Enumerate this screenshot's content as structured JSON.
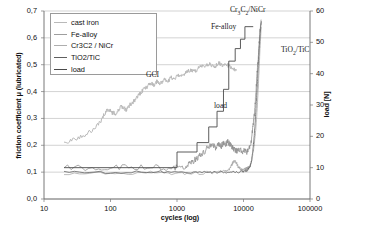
{
  "chart_data": {
    "type": "line",
    "title": "",
    "xlabel": "cycles (log)",
    "ylabel": "friction coefficient μ (lubricated)",
    "y2label": "load [N]",
    "xscale": "log",
    "xlim": [
      10,
      100000
    ],
    "ylim": [
      0.0,
      0.7
    ],
    "y2lim": [
      0,
      60
    ],
    "grid": true,
    "legend_position": "top-left",
    "xticks": [
      "10",
      "100",
      "1000",
      "10000",
      "100000"
    ],
    "xtick_values": [
      10,
      100,
      1000,
      10000,
      100000
    ],
    "yticks": [
      "0,0",
      "0,1",
      "0,2",
      "0,3",
      "0,4",
      "0,5",
      "0,6",
      "0,7"
    ],
    "ytick_values": [
      0.0,
      0.1,
      0.2,
      0.3,
      0.4,
      0.5,
      0.6,
      0.7
    ],
    "y2ticks": [
      "0",
      "10",
      "20",
      "30",
      "40",
      "50",
      "60"
    ],
    "y2tick_values": [
      0,
      10,
      20,
      30,
      40,
      50,
      60
    ],
    "series": [
      {
        "name": "cast iron",
        "color": "#b9b9b9",
        "axis": "left",
        "x": [
          20,
          28,
          40,
          55,
          72,
          85,
          95,
          105,
          118,
          130,
          145,
          160,
          175,
          195,
          215,
          240,
          270,
          300,
          330,
          360,
          400,
          450,
          500,
          560,
          640,
          720,
          820,
          930,
          1050,
          1200,
          1400,
          1600,
          1850,
          2100,
          2400,
          2800,
          3200,
          3700,
          4200,
          4800,
          5500,
          6200,
          7000,
          7800
        ],
        "y": [
          0.212,
          0.222,
          0.238,
          0.258,
          0.292,
          0.325,
          0.335,
          0.322,
          0.318,
          0.33,
          0.345,
          0.34,
          0.33,
          0.352,
          0.358,
          0.372,
          0.388,
          0.402,
          0.412,
          0.418,
          0.432,
          0.424,
          0.438,
          0.43,
          0.444,
          0.436,
          0.452,
          0.448,
          0.462,
          0.458,
          0.472,
          0.48,
          0.474,
          0.488,
          0.492,
          0.496,
          0.502,
          0.494,
          0.506,
          0.498,
          0.504,
          0.492,
          0.486,
          0.478
        ]
      },
      {
        "name": "Fe-alloy",
        "color": "#8c8c8c",
        "axis": "left",
        "x": [
          20,
          60,
          150,
          400,
          900,
          1300,
          1600,
          1900,
          2200,
          2600,
          3000,
          3400,
          3800,
          4200,
          4600,
          5000,
          5400,
          5800,
          6200,
          6600,
          7000,
          7600,
          8200,
          9000,
          9800,
          10600,
          11400,
          12200,
          13000,
          13800,
          14600,
          15400,
          16200,
          17000,
          17800,
          18400
        ],
        "y": [
          0.118,
          0.116,
          0.12,
          0.118,
          0.116,
          0.122,
          0.134,
          0.148,
          0.162,
          0.178,
          0.196,
          0.202,
          0.192,
          0.204,
          0.196,
          0.208,
          0.202,
          0.212,
          0.206,
          0.196,
          0.188,
          0.182,
          0.178,
          0.186,
          0.176,
          0.182,
          0.174,
          0.19,
          0.21,
          0.262,
          0.318,
          0.402,
          0.486,
          0.562,
          0.632,
          0.668
        ]
      },
      {
        "name": "Cr3C2 / NiCr",
        "color": "#a6a6a6",
        "axis": "left",
        "x": [
          20,
          100,
          400,
          1200,
          2500,
          4000,
          5200,
          6000,
          6600,
          7200,
          7800,
          8400,
          9000,
          9600,
          10200,
          10800,
          11400,
          12000,
          12600,
          13200,
          13800,
          14400,
          15200,
          16000,
          16800,
          17600,
          18400
        ],
        "y": [
          0.096,
          0.094,
          0.098,
          0.095,
          0.097,
          0.1,
          0.104,
          0.108,
          0.126,
          0.142,
          0.136,
          0.118,
          0.112,
          0.108,
          0.11,
          0.112,
          0.114,
          0.118,
          0.124,
          0.142,
          0.168,
          0.196,
          0.252,
          0.33,
          0.43,
          0.546,
          0.64
        ]
      },
      {
        "name": "TiO2/TiC",
        "color": "#5f5f5f",
        "axis": "left",
        "x": [
          20,
          100,
          500,
          1500,
          3000,
          5000,
          7000,
          9000,
          10500,
          11500,
          12500,
          13200,
          13800,
          14400,
          15000,
          15600,
          16200,
          16800,
          17400,
          18000,
          18600
        ],
        "y": [
          0.1,
          0.099,
          0.101,
          0.1,
          0.099,
          0.101,
          0.1,
          0.102,
          0.104,
          0.108,
          0.118,
          0.142,
          0.178,
          0.226,
          0.288,
          0.36,
          0.436,
          0.512,
          0.578,
          0.632,
          0.662
        ]
      },
      {
        "name": "load",
        "color": "#4a4a4a",
        "axis": "right",
        "steps": [
          {
            "x_start": 20,
            "x_end": 1000,
            "load": 10
          },
          {
            "x_start": 1000,
            "x_end": 2000,
            "load": 15
          },
          {
            "x_start": 2000,
            "x_end": 3000,
            "load": 18
          },
          {
            "x_start": 3000,
            "x_end": 4000,
            "load": 23
          },
          {
            "x_start": 4000,
            "x_end": 5000,
            "load": 28
          },
          {
            "x_start": 5000,
            "x_end": 6000,
            "load": 35
          },
          {
            "x_start": 6000,
            "x_end": 7500,
            "load": 44
          },
          {
            "x_start": 7500,
            "x_end": 9000,
            "load": 48
          },
          {
            "x_start": 9000,
            "x_end": 10500,
            "load": 51
          },
          {
            "x_start": 10500,
            "x_end": 14000,
            "load": 55
          }
        ]
      }
    ],
    "annotations": [
      {
        "text": "GCI",
        "x_px": 147,
        "y_px": 76,
        "subscript": ""
      },
      {
        "text": "Fe-alloy",
        "x_px": 212,
        "y_px": 27,
        "subscript": ""
      },
      {
        "text": "Cr",
        "sub1": "3",
        "mid": "C",
        "sub2": "2",
        "tail": "/NiCr",
        "x_px": 232,
        "y_px": 9
      },
      {
        "text": "load",
        "x_px": 215,
        "y_px": 106,
        "subscript": ""
      },
      {
        "text": "TiO",
        "sub1": "2",
        "tail2": "/TiC",
        "x_px": 282,
        "y_px": 50
      }
    ]
  },
  "legend": {
    "items": [
      {
        "label": "cast iron",
        "color": "#b9b9b9"
      },
      {
        "label": "Fe-alloy",
        "color": "#9e9e9e"
      },
      {
        "label": "Cr3C2 / NiCr",
        "color": "#aeaeae"
      },
      {
        "label": "TiO2/TiC",
        "color": "#5f5f5f"
      },
      {
        "label": "load",
        "color": "#4a4a4a"
      }
    ]
  },
  "annotation_text": {
    "gci": "GCI",
    "fe_alloy": "Fe-alloy",
    "cr3c2_pre": "Cr",
    "cr3c2_sub1": "3",
    "cr3c2_mid": "C",
    "cr3c2_sub2": "2",
    "cr3c2_tail": "/NiCr",
    "load": "load",
    "tio2_pre": "TiO",
    "tio2_sub": "2",
    "tio2_tail": "/TiC"
  }
}
